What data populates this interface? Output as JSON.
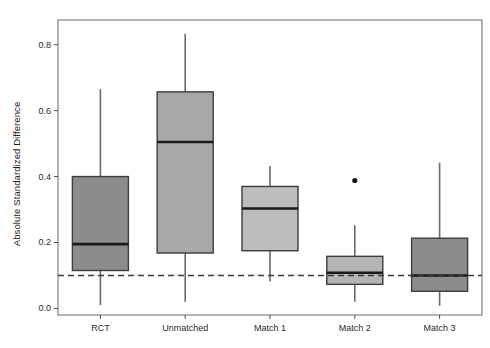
{
  "chart_data": {
    "type": "box",
    "title": "",
    "xlabel": "",
    "ylabel": "Absolute Standardized Difference",
    "ylim": [
      -0.02,
      0.875
    ],
    "yticks": [
      0.0,
      0.2,
      0.4,
      0.6,
      0.8
    ],
    "ytick_labels": [
      "0.0",
      "0.2",
      "0.4",
      "0.6",
      "0.8"
    ],
    "categories": [
      "RCT",
      "Unmatched",
      "Match 1",
      "Match 2",
      "Match 3"
    ],
    "grid": false,
    "legend": "none",
    "reference_line": {
      "value": 0.1,
      "style": "dashed",
      "color": "#3a3a3a",
      "label": "0.1"
    },
    "boxes": [
      {
        "category": "RCT",
        "whisker_low": 0.01,
        "q1": 0.115,
        "median": 0.195,
        "q3": 0.4,
        "whisker_high": 0.665,
        "outliers": [],
        "fill": "#8c8c8c"
      },
      {
        "category": "Unmatched",
        "whisker_low": 0.02,
        "q1": 0.168,
        "median": 0.505,
        "q3": 0.657,
        "whisker_high": 0.833,
        "outliers": [],
        "fill": "#a8a8a8"
      },
      {
        "category": "Match 1",
        "whisker_low": 0.082,
        "q1": 0.175,
        "median": 0.303,
        "q3": 0.37,
        "whisker_high": 0.432,
        "outliers": [],
        "fill": "#bdbdbd"
      },
      {
        "category": "Match 2",
        "whisker_low": 0.02,
        "q1": 0.073,
        "median": 0.108,
        "q3": 0.158,
        "whisker_high": 0.252,
        "outliers": [
          0.388
        ],
        "fill": "#b5b5b5"
      },
      {
        "category": "Match 3",
        "whisker_low": 0.008,
        "q1": 0.052,
        "median": 0.1,
        "q3": 0.213,
        "whisker_high": 0.442,
        "outliers": [],
        "fill": "#8c8c8c"
      }
    ],
    "colors": {
      "axis": "#4d4d4d",
      "box_border": "#3d3d3d",
      "median": "#1a1a1a",
      "whisker": "#6b6b6b",
      "outlier": "#1a1a1a",
      "reference_line": "#3a3a3a",
      "frame": "#6b6b6b",
      "background": "#ffffff"
    }
  }
}
